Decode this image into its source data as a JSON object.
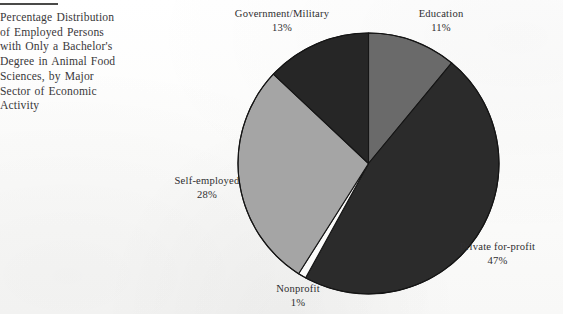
{
  "caption": {
    "lines": [
      "Percentage Distribution",
      "of Employed Persons",
      "with Only a Bachelor's",
      "Degree in Animal Food",
      "Sciences, by Major",
      "Sector of Economic",
      "Activity"
    ],
    "full_text": "Percentage Distribution of Employed Persons with Only a Bachelor's Degree in Animal Food Sciences, by Major Sector of Economic Activity"
  },
  "chart_data": {
    "type": "pie",
    "title": "Percentage Distribution of Employed Persons with Only a Bachelor's Degree in Animal Food Sciences, by Major Sector of Economic Activity",
    "xlabel": "",
    "ylabel": "",
    "units": "%",
    "legend_position": "none",
    "grid": false,
    "start_angle_deg": 0,
    "direction": "clockwise",
    "categories": [
      "Education",
      "Private for-profit",
      "Nonprofit",
      "Self-employed",
      "Government/Military"
    ],
    "values": [
      11,
      47,
      1,
      28,
      13
    ],
    "labels": [
      "Education\n11%",
      "Private for-profit\n47%",
      "Nonprofit\n1%",
      "Self-employed\n28%",
      "Government/Military\n13%"
    ],
    "slices": [
      {
        "name": "Education",
        "value": 11,
        "value_text": "11%",
        "color": "#6a6a6a"
      },
      {
        "name": "Private for-profit",
        "value": 47,
        "value_text": "47%",
        "color": "#2b2b2b"
      },
      {
        "name": "Nonprofit",
        "value": 1,
        "value_text": "1%",
        "color": "#fbfbfa"
      },
      {
        "name": "Self-employed",
        "value": 28,
        "value_text": "28%",
        "color": "#a5a5a5"
      },
      {
        "name": "Government/Military",
        "value": 13,
        "value_text": "13%",
        "color": "#262626"
      }
    ],
    "total": 100
  },
  "colors": {
    "education": "#6a6a6a",
    "private_for_profit": "#2b2b2b",
    "nonprofit": "#fbfbfa",
    "self_employed": "#a5a5a5",
    "government_military": "#262626",
    "outline": "#151515",
    "text": "#2f2e30",
    "rule": "#4a4a48",
    "page_background": "#fdfdfc"
  }
}
